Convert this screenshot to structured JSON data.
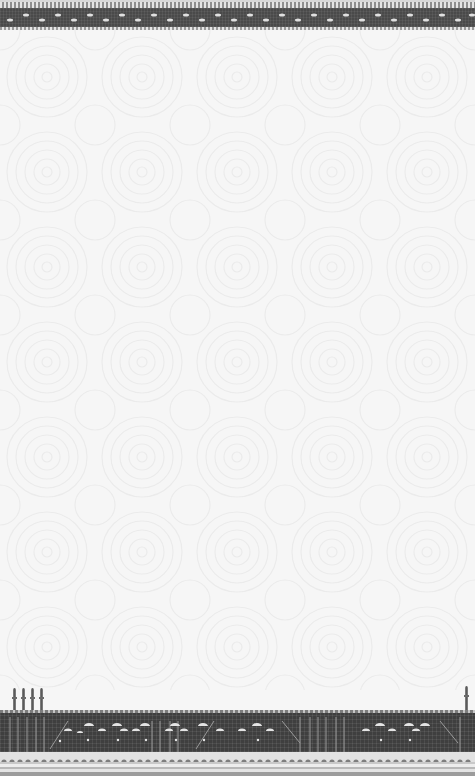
{
  "artwork": {
    "description": "Decorative background card with ornamental mosaic borders",
    "palette": {
      "background": "#f6f6f6",
      "swirl": "#ececec",
      "mosaic_dark": "#3f3f3f",
      "mosaic_light": "#e8e8e8",
      "bead": "#8e8e8e"
    },
    "top_border": {
      "motif": "bead row over dark mosaic band with arch dots"
    },
    "body": {
      "motif": "faint concentric swirl pattern"
    },
    "bottom_border": {
      "motif": "mosque skyline mosaic with domes and columns",
      "minarets_left": [
        13,
        22,
        31,
        40
      ],
      "minarets_right": [
        466
      ]
    }
  }
}
